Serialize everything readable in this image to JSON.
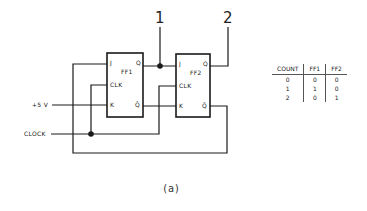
{
  "diagram": {
    "caption": "(a)",
    "node_labels": {
      "node1": "1",
      "node2": "2"
    },
    "inputs": {
      "supply": "+5 V",
      "clock": "CLOCK"
    },
    "flip_flops": [
      {
        "name": "FF1",
        "pins": {
          "j": "J",
          "clk": "CLK",
          "k": "K",
          "q": "Q",
          "qbar": "Q̄"
        }
      },
      {
        "name": "FF2",
        "pins": {
          "j": "J",
          "clk": "CLK",
          "k": "K",
          "q": "Q",
          "qbar": "Q̄"
        }
      }
    ],
    "line_color": "#1a1a1a"
  },
  "truth_table": {
    "headers": [
      "COUNT",
      "FF1",
      "FF2"
    ],
    "rows": [
      [
        "0",
        "0",
        "0"
      ],
      [
        "1",
        "1",
        "0"
      ],
      [
        "2",
        "0",
        "1"
      ]
    ]
  }
}
